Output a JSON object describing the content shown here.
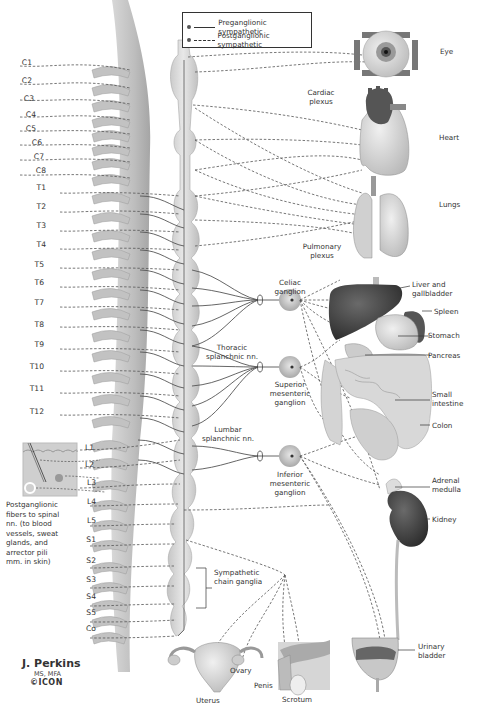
{
  "legend": {
    "preganglionic": "Preganglionic sympathetic",
    "postganglionic": "Postganglionic sympathetic"
  },
  "spinal_segments": [
    "C1",
    "C2",
    "C3",
    "C4",
    "C5",
    "C6",
    "C7",
    "C8",
    "T1",
    "T2",
    "T3",
    "T4",
    "T5",
    "T6",
    "T7",
    "T8",
    "T9",
    "T10",
    "T11",
    "T12",
    "L1",
    "L2",
    "L3",
    "L4",
    "L5",
    "S1",
    "S2",
    "S3",
    "S4",
    "S5",
    "Co"
  ],
  "organs": {
    "eye": "Eye",
    "heart": "Heart",
    "lungs": "Lungs",
    "liver": "Liver and gallbladder",
    "liver_l1": "Liver and",
    "liver_l2": "gallbladder",
    "spleen": "Spleen",
    "stomach": "Stomach",
    "pancreas": "Pancreas",
    "small_intestine_l1": "Small",
    "small_intestine_l2": "intestine",
    "colon": "Colon",
    "adrenal_l1": "Adrenal",
    "adrenal_l2": "medulla",
    "kidney": "Kidney",
    "bladder_l1": "Urinary",
    "bladder_l2": "bladder",
    "uterus": "Uterus",
    "ovary": "Ovary",
    "penis": "Penis",
    "scrotum": "Scrotum"
  },
  "plexuses": {
    "cardiac_l1": "Cardiac",
    "cardiac_l2": "plexus",
    "pulmonary_l1": "Pulmonary",
    "pulmonary_l2": "plexus"
  },
  "ganglia": {
    "celiac_l1": "Celiac",
    "celiac_l2": "ganglion",
    "superior_l1": "Superior",
    "superior_l2": "mesenteric",
    "superior_l3": "ganglion",
    "inferior_l1": "Inferior",
    "inferior_l2": "mesenteric",
    "inferior_l3": "ganglion",
    "chain_l1": "Sympathetic",
    "chain_l2": "chain ganglia"
  },
  "nerves": {
    "thoracic_l1": "Thoracic",
    "thoracic_l2": "splanchnic nn.",
    "lumbar_l1": "Lumbar",
    "lumbar_l2": "splanchnic nn."
  },
  "skin_note": {
    "l1": "Postganglionic",
    "l2": "fibers to spinal",
    "l3": "nn. (to blood",
    "l4": "vessels, sweat",
    "l5": "glands, and",
    "l6": "arrector pili",
    "l7": "mm. in skin)"
  },
  "signature": {
    "name": "J. Perkins",
    "credentials": "MS, MFA",
    "logo": "©ICON"
  },
  "colors": {
    "spine": "#c9c9c9",
    "chain": "#d4d4d4",
    "ganglion": "#cfcfcf",
    "liver": "#4a4a4a",
    "organ": "#d8d8d8",
    "line": "#444444"
  }
}
